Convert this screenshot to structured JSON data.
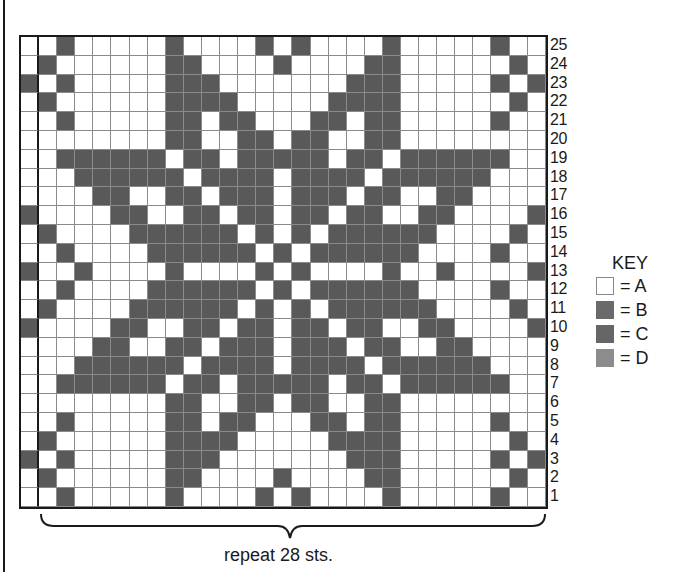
{
  "chart": {
    "columns": 29,
    "rows_count": 25,
    "repeat_label": "repeat 28 sts.",
    "cell_colors": {
      "A": "#ffffff",
      "dark": "#595959"
    },
    "rows": [
      {
        "num": "25",
        "cells": "00100000100001010000100000100"
      },
      {
        "num": "24",
        "cells": "01000000110000100001100000010"
      },
      {
        "num": "23",
        "cells": "10100000111000000011100000101"
      },
      {
        "num": "22",
        "cells": "01000000111100000111100000010"
      },
      {
        "num": "21",
        "cells": "00100000110110001101100000100"
      },
      {
        "num": "20",
        "cells": "00000000110011011001100000000"
      },
      {
        "num": "19",
        "cells": "00111111011011111011011111100"
      },
      {
        "num": "18",
        "cells": "00011111101111011110111111000"
      },
      {
        "num": "17",
        "cells": "00001100110111011101100110000"
      },
      {
        "num": "16",
        "cells": "10000110011011011011001100001"
      },
      {
        "num": "15",
        "cells": "01000011111101010111111000010"
      },
      {
        "num": "14",
        "cells": "00100001111110101111110000100"
      },
      {
        "num": "13",
        "cells": "10010000100001010000100100001"
      },
      {
        "num": "12",
        "cells": "00100001111110101111110000100"
      },
      {
        "num": "11",
        "cells": "01000011111101010111111000010"
      },
      {
        "num": "10",
        "cells": "10000110011011011011001100001"
      },
      {
        "num": "9",
        "cells": "00001100110111011101100110000"
      },
      {
        "num": "8",
        "cells": "00011111101111011110111111000"
      },
      {
        "num": "7",
        "cells": "00111111011011111011011111100"
      },
      {
        "num": "6",
        "cells": "00000000110011011001100000000"
      },
      {
        "num": "5",
        "cells": "00100000110110001101100000100"
      },
      {
        "num": "4",
        "cells": "01000000111100000111100000010"
      },
      {
        "num": "3",
        "cells": "10100000111000000011100000101"
      },
      {
        "num": "2",
        "cells": "01000000110000100001100000010"
      },
      {
        "num": "1",
        "cells": "00100000100001010000100000100"
      }
    ]
  },
  "key": {
    "title": "KEY",
    "items": [
      {
        "swatch": "white",
        "color": "#ffffff",
        "label": "= A"
      },
      {
        "swatch": "dark",
        "color": "#6a6a6a",
        "label": "= B"
      },
      {
        "swatch": "dark",
        "color": "#666666",
        "label": "= C"
      },
      {
        "swatch": "light",
        "color": "#8c8c8c",
        "label": "= D"
      }
    ]
  }
}
